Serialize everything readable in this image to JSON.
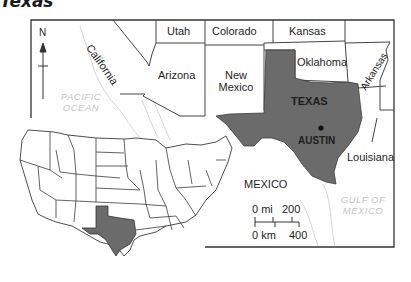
{
  "title": "Texas",
  "colors": {
    "highlight_fill": "#6b6b6b",
    "border": "#333333",
    "water_text": "#c4c4c4",
    "coast_line": "#d8d8d8"
  },
  "compass": {
    "label": "N"
  },
  "states": {
    "california": "California",
    "utah": "Utah",
    "colorado": "Colorado",
    "kansas": "Kansas",
    "arizona": "Arizona",
    "new_mexico_1": "New",
    "new_mexico_2": "Mexico",
    "oklahoma": "Oklahoma",
    "arkansas": "Arkansas",
    "texas": "TEXAS",
    "louisiana": "Louisiana"
  },
  "capital": {
    "name": "AUSTIN"
  },
  "countries": {
    "mexico": "MEXICO"
  },
  "water": {
    "pacific_1": "PACIFIC",
    "pacific_2": "OCEAN",
    "gulf_1": "GULF OF",
    "gulf_2": "MEXICO"
  },
  "scale": {
    "mi_zero": "0 mi",
    "mi_value": "200",
    "km_zero": "0 km",
    "km_value": "400"
  },
  "inset": {
    "description": "Contiguous United States locator map with Texas highlighted"
  }
}
